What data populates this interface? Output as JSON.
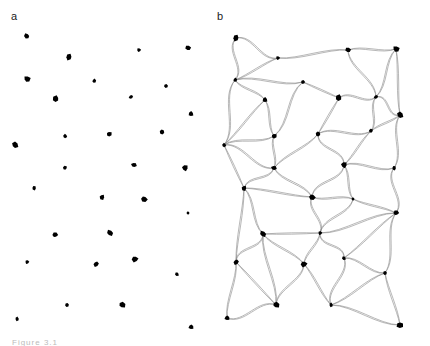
{
  "figure": {
    "panels": [
      {
        "label": "a",
        "description": "Scattered cell bodies (dots)"
      },
      {
        "label": "b",
        "description": "Network of cells connected by wavy double-stranded links"
      }
    ],
    "caption": "Figure 3.1"
  },
  "panel_a": {
    "dot_color": "#000000",
    "dots": [
      [
        27,
        36
      ],
      [
        69,
        57
      ],
      [
        139,
        50
      ],
      [
        188,
        48
      ],
      [
        27,
        79
      ],
      [
        94,
        81
      ],
      [
        166,
        86
      ],
      [
        56,
        99
      ],
      [
        131,
        97
      ],
      [
        191,
        114
      ],
      [
        15,
        145
      ],
      [
        65,
        136
      ],
      [
        109,
        134
      ],
      [
        162,
        132
      ],
      [
        65,
        168
      ],
      [
        134,
        165
      ],
      [
        185,
        168
      ],
      [
        34,
        188
      ],
      [
        102,
        197
      ],
      [
        144,
        199
      ],
      [
        188,
        213
      ],
      [
        55,
        235
      ],
      [
        110,
        233
      ],
      [
        27,
        262
      ],
      [
        96,
        264
      ],
      [
        135,
        259
      ],
      [
        177,
        274
      ],
      [
        67,
        305
      ],
      [
        122,
        305
      ],
      [
        17,
        319
      ],
      [
        191,
        327
      ]
    ]
  },
  "panel_b": {
    "node_color": "#000000",
    "edge_color": "#888888",
    "nodes": [
      [
        236,
        38
      ],
      [
        278,
        58
      ],
      [
        348,
        50
      ],
      [
        396,
        49
      ],
      [
        235,
        80
      ],
      [
        303,
        82
      ],
      [
        339,
        98
      ],
      [
        376,
        97
      ],
      [
        265,
        100
      ],
      [
        400,
        115
      ],
      [
        224,
        145
      ],
      [
        274,
        136
      ],
      [
        318,
        134
      ],
      [
        371,
        131
      ],
      [
        274,
        168
      ],
      [
        344,
        165
      ],
      [
        394,
        168
      ],
      [
        244,
        188
      ],
      [
        312,
        197
      ],
      [
        353,
        199
      ],
      [
        396,
        213
      ],
      [
        263,
        234
      ],
      [
        320,
        233
      ],
      [
        236,
        262
      ],
      [
        304,
        264
      ],
      [
        344,
        258
      ],
      [
        385,
        273
      ],
      [
        276,
        305
      ],
      [
        331,
        305
      ],
      [
        227,
        318
      ],
      [
        400,
        325
      ]
    ],
    "edges": [
      [
        0,
        1
      ],
      [
        1,
        2
      ],
      [
        2,
        3
      ],
      [
        0,
        4
      ],
      [
        1,
        4
      ],
      [
        4,
        5
      ],
      [
        2,
        7
      ],
      [
        5,
        6
      ],
      [
        6,
        7
      ],
      [
        3,
        7
      ],
      [
        3,
        9
      ],
      [
        7,
        9
      ],
      [
        4,
        8
      ],
      [
        8,
        11
      ],
      [
        4,
        10
      ],
      [
        8,
        10
      ],
      [
        10,
        11
      ],
      [
        11,
        5
      ],
      [
        6,
        12
      ],
      [
        12,
        13
      ],
      [
        13,
        7
      ],
      [
        13,
        9
      ],
      [
        10,
        14
      ],
      [
        11,
        14
      ],
      [
        12,
        14
      ],
      [
        12,
        15
      ],
      [
        13,
        15
      ],
      [
        15,
        16
      ],
      [
        9,
        16
      ],
      [
        10,
        17
      ],
      [
        14,
        17
      ],
      [
        14,
        18
      ],
      [
        17,
        18
      ],
      [
        15,
        18
      ],
      [
        18,
        19
      ],
      [
        15,
        19
      ],
      [
        16,
        20
      ],
      [
        19,
        20
      ],
      [
        17,
        21
      ],
      [
        18,
        22
      ],
      [
        21,
        22
      ],
      [
        19,
        22
      ],
      [
        20,
        22
      ],
      [
        17,
        23
      ],
      [
        21,
        23
      ],
      [
        21,
        24
      ],
      [
        22,
        24
      ],
      [
        22,
        25
      ],
      [
        20,
        25
      ],
      [
        25,
        26
      ],
      [
        20,
        26
      ],
      [
        23,
        27
      ],
      [
        24,
        27
      ],
      [
        21,
        27
      ],
      [
        24,
        28
      ],
      [
        25,
        28
      ],
      [
        26,
        28
      ],
      [
        23,
        29
      ],
      [
        27,
        29
      ],
      [
        26,
        30
      ],
      [
        28,
        30
      ]
    ]
  }
}
